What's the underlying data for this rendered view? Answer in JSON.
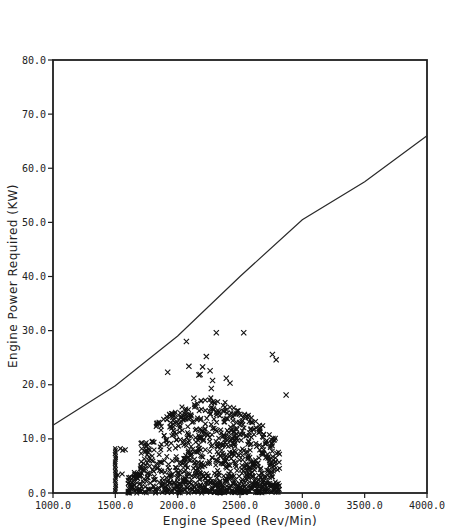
{
  "chart_data": {
    "type": "scatter",
    "title": "",
    "xlabel": "Engine Speed (Rev/Min)",
    "ylabel": "Engine Power Required (KW)",
    "xlim": [
      1000,
      4000
    ],
    "ylim": [
      0,
      80
    ],
    "grid": false,
    "legend": null,
    "x_ticks": [
      "1000.0",
      "1500.0",
      "2000.0",
      "2500.0",
      "3000.0",
      "3500.0",
      "4000.0"
    ],
    "y_ticks": [
      "0.0",
      "10.0",
      "20.0",
      "30.0",
      "40.0",
      "50.0",
      "60.0",
      "70.0",
      "80.0"
    ],
    "series": [
      {
        "name": "Maximum engine power",
        "kind": "line",
        "color": "#222222",
        "x": [
          1000,
          1500,
          2000,
          2500,
          3000,
          3500,
          4000
        ],
        "y": [
          12.5,
          19.8,
          29.0,
          40.0,
          50.5,
          57.5,
          66.0
        ]
      },
      {
        "name": "Operating points",
        "kind": "scatter",
        "marker": "x",
        "color": "#111111",
        "outliers": {
          "x": [
            2070,
            2310,
            2530,
            1920,
            2090,
            2200,
            2230,
            2170,
            2180,
            2260,
            2270,
            2280,
            2390,
            2420,
            2760,
            2790,
            2870,
            2130
          ],
          "y": [
            28.0,
            29.6,
            29.6,
            22.3,
            23.4,
            23.3,
            25.2,
            21.8,
            21.9,
            22.6,
            19.3,
            20.8,
            21.2,
            20.3,
            25.6,
            24.6,
            18.1,
            17.5
          ]
        },
        "idle_column": {
          "x": 1500,
          "y_range": [
            0.2,
            8.3
          ]
        },
        "cluster": {
          "x_range": [
            1600,
            2820
          ],
          "y_range": [
            0,
            17.5
          ],
          "peak_x": 2300,
          "approx_count": 900
        }
      }
    ]
  }
}
